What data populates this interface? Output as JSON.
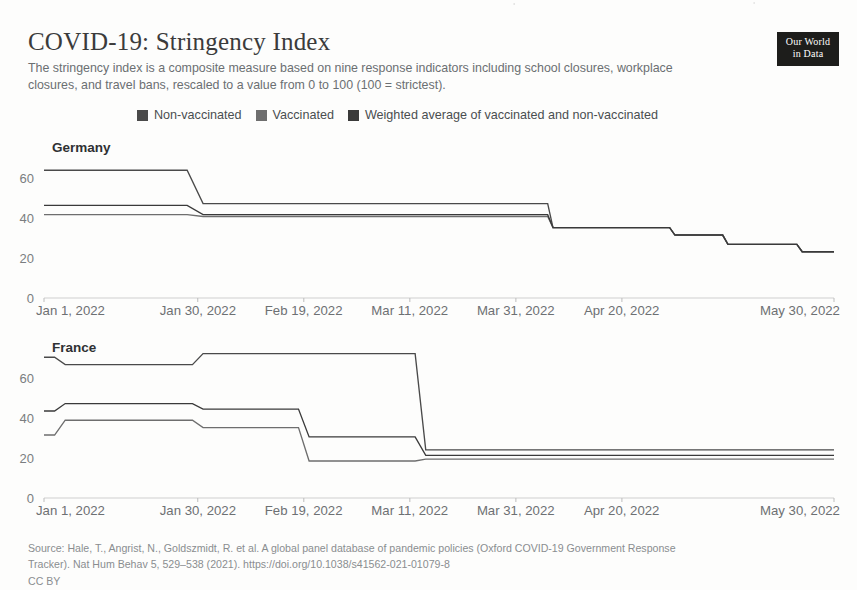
{
  "header": {
    "title": "COVID-19: Stringency Index",
    "subtitle": "The stringency index is a composite measure based on nine response indicators including school closures, workplace closures, and travel bans, rescaled to a value from 0 to 100 (100 = strictest).",
    "logo_line1": "Our World",
    "logo_line2": "in Data"
  },
  "legend": {
    "position": "top",
    "items": [
      {
        "label": "Non-vaccinated",
        "color": "#4a4a4a"
      },
      {
        "label": "Vaccinated",
        "color": "#6e6e6e"
      },
      {
        "label": "Weighted average of vaccinated and non-vaccinated",
        "color": "#3a3a3a"
      }
    ]
  },
  "footer": {
    "line1": "Source: Hale, T., Angrist, N., Goldszmidt, R. et al. A global panel database of pandemic policies (Oxford COVID-19 Government Response",
    "line2": "Tracker). Nat Hum Behav 5, 529–538 (2021). https://doi.org/10.1038/s41562-021-01079-8",
    "license": "CC BY"
  },
  "chart_data": [
    {
      "type": "line",
      "title": "Germany",
      "xlabel": "",
      "ylabel": "",
      "ylim": [
        0,
        70
      ],
      "yticks": [
        0,
        20,
        40,
        60
      ],
      "grid": false,
      "x_range": [
        "Jan 1, 2022",
        "May 30, 2022"
      ],
      "xticks": [
        "Jan 1, 2022",
        "Jan 30, 2022",
        "Feb 19, 2022",
        "Mar 11, 2022",
        "Mar 31, 2022",
        "Apr 20, 2022",
        "May 30, 2022"
      ],
      "xtick_days": [
        0,
        29,
        49,
        69,
        89,
        109,
        149
      ],
      "series": [
        {
          "name": "Non-vaccinated",
          "color": "#4a4a4a",
          "points": [
            [
              0,
              63.89
            ],
            [
              27,
              63.89
            ],
            [
              30,
              47.22
            ],
            [
              95,
              47.22
            ],
            [
              96,
              35.19
            ],
            [
              118,
              35.19
            ],
            [
              119,
              31.48
            ],
            [
              128,
              31.48
            ],
            [
              129,
              26.85
            ],
            [
              142,
              26.85
            ],
            [
              143,
              23.15
            ],
            [
              149,
              23.15
            ]
          ]
        },
        {
          "name": "Vaccinated",
          "color": "#6e6e6e",
          "points": [
            [
              0,
              41.67
            ],
            [
              27,
              41.67
            ],
            [
              30,
              40.74
            ],
            [
              95,
              40.74
            ],
            [
              96,
              35.19
            ],
            [
              118,
              35.19
            ],
            [
              119,
              31.48
            ],
            [
              128,
              31.48
            ],
            [
              129,
              26.85
            ],
            [
              142,
              26.85
            ],
            [
              143,
              23.15
            ],
            [
              149,
              23.15
            ]
          ]
        },
        {
          "name": "Weighted average of vaccinated and non-vaccinated",
          "color": "#3a3a3a",
          "points": [
            [
              0,
              46.3
            ],
            [
              27,
              46.3
            ],
            [
              30,
              41.67
            ],
            [
              95,
              41.67
            ],
            [
              96,
              35.19
            ],
            [
              118,
              35.19
            ],
            [
              119,
              31.48
            ],
            [
              128,
              31.48
            ],
            [
              129,
              26.85
            ],
            [
              142,
              26.85
            ],
            [
              143,
              23.15
            ],
            [
              149,
              23.15
            ]
          ]
        }
      ]
    },
    {
      "type": "line",
      "title": "France",
      "xlabel": "",
      "ylabel": "",
      "ylim": [
        0,
        70
      ],
      "yticks": [
        0,
        20,
        40,
        60
      ],
      "grid": false,
      "x_range": [
        "Jan 1, 2022",
        "May 30, 2022"
      ],
      "xticks": [
        "Jan 1, 2022",
        "Jan 30, 2022",
        "Feb 19, 2022",
        "Mar 11, 2022",
        "Mar 31, 2022",
        "Apr 20, 2022",
        "May 30, 2022"
      ],
      "xtick_days": [
        0,
        29,
        49,
        69,
        89,
        109,
        149
      ],
      "series": [
        {
          "name": "Non-vaccinated",
          "color": "#4a4a4a",
          "points": [
            [
              0,
              70.37
            ],
            [
              2,
              70.37
            ],
            [
              4,
              66.67
            ],
            [
              28,
              66.67
            ],
            [
              30,
              72.22
            ],
            [
              70,
              72.22
            ],
            [
              72,
              24.07
            ],
            [
              149,
              24.07
            ]
          ]
        },
        {
          "name": "Vaccinated",
          "color": "#6e6e6e",
          "points": [
            [
              0,
              31.48
            ],
            [
              2,
              31.48
            ],
            [
              4,
              38.89
            ],
            [
              28,
              38.89
            ],
            [
              30,
              35.19
            ],
            [
              48,
              35.19
            ],
            [
              50,
              18.52
            ],
            [
              70,
              18.52
            ],
            [
              72,
              19.44
            ],
            [
              149,
              19.44
            ]
          ]
        },
        {
          "name": "Weighted average of vaccinated and non-vaccinated",
          "color": "#3a3a3a",
          "points": [
            [
              0,
              43.52
            ],
            [
              2,
              43.52
            ],
            [
              4,
              47.22
            ],
            [
              28,
              47.22
            ],
            [
              30,
              44.44
            ],
            [
              48,
              44.44
            ],
            [
              50,
              30.56
            ],
            [
              70,
              30.56
            ],
            [
              72,
              21.3
            ],
            [
              149,
              21.3
            ]
          ]
        }
      ]
    }
  ]
}
